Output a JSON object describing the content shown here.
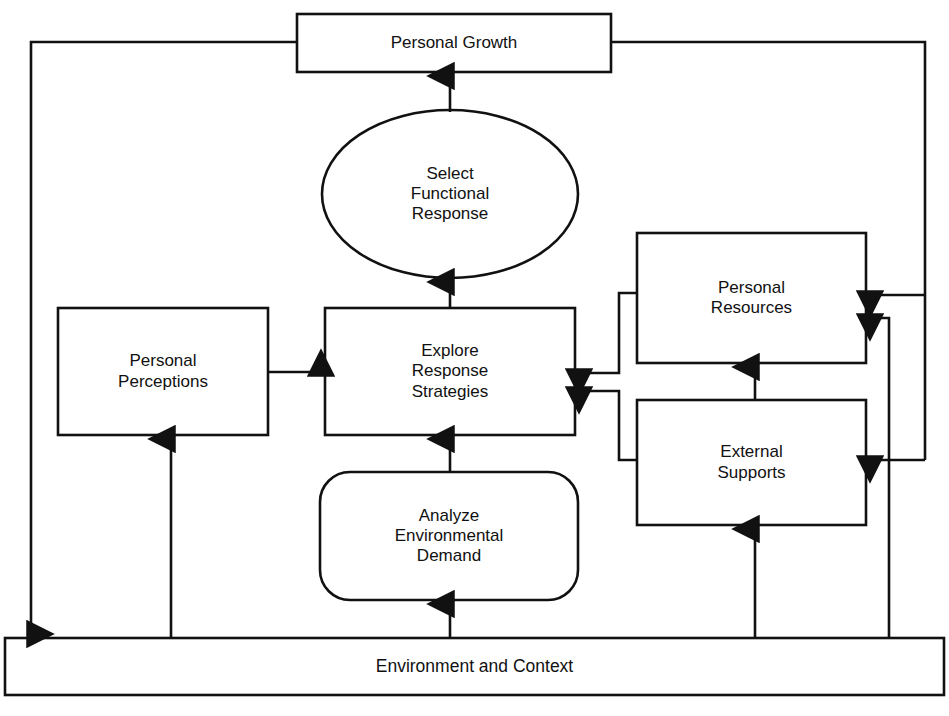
{
  "diagram": {
    "type": "flow-diagram",
    "title_text": "Personal Growth",
    "stroke_color": "#111111",
    "fill_color": "#ffffff",
    "nodes": [
      {
        "id": "personal-growth",
        "label": "Personal Growth",
        "shape": "rectangle",
        "x": 297,
        "y": 14,
        "w": 314,
        "h": 58
      },
      {
        "id": "select-functional-response",
        "label": "Select\nFunctional\nResponse",
        "shape": "ellipse",
        "x": 322,
        "y": 110,
        "w": 256,
        "h": 168
      },
      {
        "id": "personal-perceptions",
        "label": "Personal\nPerceptions",
        "shape": "rectangle",
        "x": 58,
        "y": 308,
        "w": 210,
        "h": 127
      },
      {
        "id": "explore-response-strategies",
        "label": "Explore\nResponse\nStrategies",
        "shape": "rectangle",
        "x": 325,
        "y": 308,
        "w": 250,
        "h": 127
      },
      {
        "id": "personal-resources",
        "label": "Personal\nResources",
        "shape": "rectangle",
        "x": 637,
        "y": 233,
        "w": 229,
        "h": 130
      },
      {
        "id": "external-supports",
        "label": "External\nSupports",
        "shape": "rectangle",
        "x": 637,
        "y": 400,
        "w": 229,
        "h": 125
      },
      {
        "id": "analyze-environmental-demand",
        "label": "Analyze\nEnvironmental\nDemand",
        "shape": "rounded-rectangle",
        "x": 320,
        "y": 472,
        "w": 258,
        "h": 128
      },
      {
        "id": "environment-and-context",
        "label": "Environment and Context",
        "shape": "rectangle",
        "x": 5,
        "y": 638,
        "w": 939,
        "h": 57
      }
    ],
    "edges": [
      {
        "id": "edge-response-to-growth",
        "from": "select-functional-response",
        "to": "personal-growth",
        "arrow": "up"
      },
      {
        "id": "edge-explore-to-response",
        "from": "explore-response-strategies",
        "to": "select-functional-response",
        "arrow": "up"
      },
      {
        "id": "edge-perceptions-to-explore",
        "from": "personal-perceptions",
        "to": "explore-response-strategies",
        "arrow": "right"
      },
      {
        "id": "edge-resources-to-explore",
        "from": "personal-resources",
        "to": "explore-response-strategies",
        "arrow": "left"
      },
      {
        "id": "edge-supports-to-explore",
        "from": "external-supports",
        "to": "explore-response-strategies",
        "arrow": "left"
      },
      {
        "id": "edge-demand-to-explore",
        "from": "analyze-environmental-demand",
        "to": "explore-response-strategies",
        "arrow": "up"
      },
      {
        "id": "edge-supports-to-resources",
        "from": "external-supports",
        "to": "personal-resources",
        "arrow": "up"
      },
      {
        "id": "edge-environment-to-demand",
        "from": "environment-and-context",
        "to": "analyze-environmental-demand",
        "arrow": "up"
      },
      {
        "id": "edge-environment-to-perceptions",
        "from": "environment-and-context",
        "to": "personal-perceptions",
        "arrow": "up"
      },
      {
        "id": "edge-environment-to-supports",
        "from": "environment-and-context",
        "to": "external-supports",
        "arrow": "up"
      },
      {
        "id": "edge-environment-to-resources",
        "from": "environment-and-context",
        "to": "personal-resources",
        "arrow": "left"
      },
      {
        "id": "edge-growth-to-environment",
        "from": "personal-growth",
        "to": "environment-and-context",
        "arrow": "down"
      },
      {
        "id": "edge-growth-to-resources",
        "from": "personal-growth",
        "to": "personal-resources",
        "arrow": "left"
      },
      {
        "id": "edge-growth-to-supports",
        "from": "personal-growth",
        "to": "external-supports",
        "arrow": "left"
      }
    ]
  }
}
